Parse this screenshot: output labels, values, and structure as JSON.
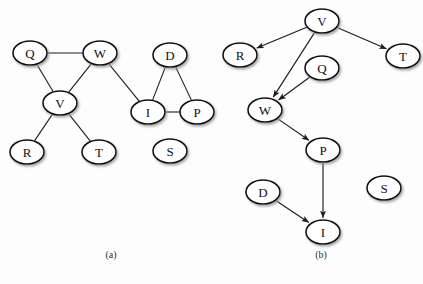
{
  "figure": {
    "background": "#fdfdfd",
    "node_fill": "#ffffff",
    "node_stroke": "#111111",
    "edge_color": "#1c1c1c",
    "panels": [
      {
        "id": "panel-a",
        "caption": "(a)",
        "caption_pos": {
          "x": 111,
          "y": 258
        },
        "type": "undirected-graph",
        "nodes": [
          {
            "id": "Q",
            "label": "Q",
            "x": 30,
            "y": 53,
            "rx": 17,
            "ry": 12
          },
          {
            "id": "W",
            "label": "W",
            "x": 100,
            "y": 53,
            "rx": 17,
            "ry": 12
          },
          {
            "id": "V",
            "label": "V",
            "x": 60,
            "y": 103,
            "rx": 17,
            "ry": 12
          },
          {
            "id": "R",
            "label": "R",
            "x": 27,
            "y": 152,
            "rx": 17,
            "ry": 12
          },
          {
            "id": "T",
            "label": "T",
            "x": 99,
            "y": 152,
            "rx": 17,
            "ry": 12
          },
          {
            "id": "D",
            "label": "D",
            "x": 170,
            "y": 55,
            "rx": 17,
            "ry": 12
          },
          {
            "id": "I",
            "label": "I",
            "x": 148,
            "y": 112,
            "rx": 17,
            "ry": 12
          },
          {
            "id": "P",
            "label": "P",
            "x": 197,
            "y": 112,
            "rx": 17,
            "ry": 12
          },
          {
            "id": "S",
            "label": "S",
            "x": 170,
            "y": 151,
            "rx": 17,
            "ry": 12
          }
        ],
        "edges": [
          {
            "from": "Q",
            "to": "W"
          },
          {
            "from": "Q",
            "to": "V"
          },
          {
            "from": "V",
            "to": "W"
          },
          {
            "from": "V",
            "to": "R"
          },
          {
            "from": "V",
            "to": "T"
          },
          {
            "from": "W",
            "to": "I"
          },
          {
            "from": "D",
            "to": "I"
          },
          {
            "from": "D",
            "to": "P"
          },
          {
            "from": "I",
            "to": "P"
          }
        ],
        "isolated_nodes": [
          "S"
        ]
      },
      {
        "id": "panel-b",
        "caption": "(b)",
        "caption_pos": {
          "x": 321,
          "y": 258
        },
        "type": "directed-graph",
        "nodes": [
          {
            "id": "V",
            "label": "V",
            "x": 322,
            "y": 21,
            "rx": 17,
            "ry": 12
          },
          {
            "id": "R",
            "label": "R",
            "x": 240,
            "y": 55,
            "rx": 17,
            "ry": 12
          },
          {
            "id": "T",
            "label": "T",
            "x": 403,
            "y": 56,
            "rx": 17,
            "ry": 12
          },
          {
            "id": "Q",
            "label": "Q",
            "x": 322,
            "y": 68,
            "rx": 17,
            "ry": 12
          },
          {
            "id": "W",
            "label": "W",
            "x": 265,
            "y": 110,
            "rx": 17,
            "ry": 12
          },
          {
            "id": "P",
            "label": "P",
            "x": 323,
            "y": 150,
            "rx": 17,
            "ry": 12
          },
          {
            "id": "D",
            "label": "D",
            "x": 263,
            "y": 192,
            "rx": 17,
            "ry": 12
          },
          {
            "id": "I",
            "label": "I",
            "x": 323,
            "y": 232,
            "rx": 17,
            "ry": 12
          },
          {
            "id": "S",
            "label": "S",
            "x": 384,
            "y": 188,
            "rx": 17,
            "ry": 12
          }
        ],
        "edges": [
          {
            "from": "V",
            "to": "R",
            "directed": true
          },
          {
            "from": "V",
            "to": "T",
            "directed": true
          },
          {
            "from": "V",
            "to": "W",
            "directed": true
          },
          {
            "from": "Q",
            "to": "W",
            "directed": true
          },
          {
            "from": "W",
            "to": "P",
            "directed": true
          },
          {
            "from": "P",
            "to": "I",
            "directed": true
          },
          {
            "from": "D",
            "to": "I",
            "directed": true
          }
        ],
        "isolated_nodes": [
          "S"
        ]
      }
    ]
  }
}
